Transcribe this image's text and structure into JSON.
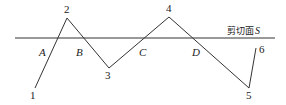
{
  "plane": {
    "label": "剪切面",
    "symbol": "S",
    "y": 38,
    "x1": 15,
    "x2": 275
  },
  "vertices": [
    {
      "id": "1",
      "x": 35,
      "y": 88
    },
    {
      "id": "2",
      "x": 67,
      "y": 18
    },
    {
      "id": "3",
      "x": 109,
      "y": 68
    },
    {
      "id": "4",
      "x": 169,
      "y": 17
    },
    {
      "id": "5",
      "x": 249,
      "y": 88
    },
    {
      "id": "6",
      "x": 256,
      "y": 48
    }
  ],
  "vertex_labels": [
    "1",
    "2",
    "3",
    "4",
    "5",
    "6"
  ],
  "intersection_labels": [
    "A",
    "B",
    "C",
    "D"
  ],
  "colors": {
    "line": "#333333",
    "text": "#222222"
  }
}
